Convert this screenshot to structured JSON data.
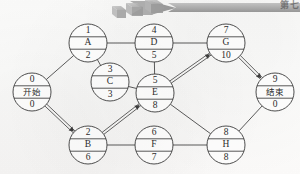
{
  "page": {
    "chapter_label": "第七",
    "figure_type": "activity-network-diagram",
    "background_color": "#fdfdfc",
    "ink_color": "#3a3a3a"
  },
  "decoration": {
    "banner_arrow_name": "chapter-banner-arrow",
    "cube_count": 3,
    "arrow_color": "#9a9a9a",
    "cube_color": "#a8a8a8"
  },
  "graph": {
    "node_radius": 19,
    "nodes": [
      {
        "key": "start",
        "top": "0",
        "mid": "开始",
        "bottom": "0",
        "cx": 32,
        "cy": 92,
        "mid_is_cn": true
      },
      {
        "key": "A",
        "top": "1",
        "mid": "A",
        "bottom": "2",
        "cx": 88,
        "cy": 43,
        "mid_is_cn": false
      },
      {
        "key": "C",
        "top": "3",
        "mid": "C",
        "bottom": "3",
        "cx": 110,
        "cy": 82,
        "mid_is_cn": false
      },
      {
        "key": "B",
        "top": "2",
        "mid": "B",
        "bottom": "6",
        "cx": 88,
        "cy": 145,
        "mid_is_cn": false
      },
      {
        "key": "D",
        "top": "4",
        "mid": "D",
        "bottom": "5",
        "cx": 154,
        "cy": 43,
        "mid_is_cn": false
      },
      {
        "key": "E",
        "top": "5",
        "mid": "E",
        "bottom": "8",
        "cx": 155,
        "cy": 93,
        "mid_is_cn": false
      },
      {
        "key": "F",
        "top": "6",
        "mid": "F",
        "bottom": "7",
        "cx": 154,
        "cy": 145,
        "mid_is_cn": false
      },
      {
        "key": "G",
        "top": "7",
        "mid": "G",
        "bottom": "10",
        "cx": 226,
        "cy": 43,
        "mid_is_cn": false
      },
      {
        "key": "H",
        "top": "8",
        "mid": "H",
        "bottom": "8",
        "cx": 226,
        "cy": 145,
        "mid_is_cn": false
      },
      {
        "key": "end",
        "top": "9",
        "mid": "结束",
        "bottom": "0",
        "cx": 275,
        "cy": 92,
        "mid_is_cn": true
      }
    ],
    "edges": [
      {
        "from": "start",
        "to": "A",
        "critical": false
      },
      {
        "from": "start",
        "to": "B",
        "critical": true
      },
      {
        "from": "A",
        "to": "D",
        "critical": false
      },
      {
        "from": "A",
        "to": "C",
        "critical": false
      },
      {
        "from": "C",
        "to": "E",
        "critical": false
      },
      {
        "from": "B",
        "to": "E",
        "critical": true
      },
      {
        "from": "B",
        "to": "F",
        "critical": false
      },
      {
        "from": "D",
        "to": "E",
        "critical": false
      },
      {
        "from": "D",
        "to": "G",
        "critical": false
      },
      {
        "from": "E",
        "to": "G",
        "critical": true
      },
      {
        "from": "E",
        "to": "H",
        "critical": false
      },
      {
        "from": "F",
        "to": "H",
        "critical": false
      },
      {
        "from": "G",
        "to": "end",
        "critical": true
      },
      {
        "from": "H",
        "to": "end",
        "critical": false
      }
    ]
  }
}
